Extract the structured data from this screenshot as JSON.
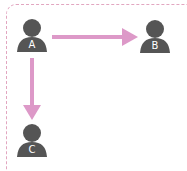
{
  "diagram": {
    "nodes": [
      {
        "id": "A",
        "label": "A",
        "x": 32,
        "y": 37
      },
      {
        "id": "B",
        "label": "B",
        "x": 155,
        "y": 37
      },
      {
        "id": "C",
        "label": "C",
        "x": 32,
        "y": 140
      }
    ],
    "edges": [
      {
        "from": "A",
        "to": "B"
      },
      {
        "from": "A",
        "to": "C"
      }
    ],
    "colors": {
      "person": "#555555",
      "arrow": "#dd99c8",
      "frame": "#e2a6c0"
    }
  }
}
